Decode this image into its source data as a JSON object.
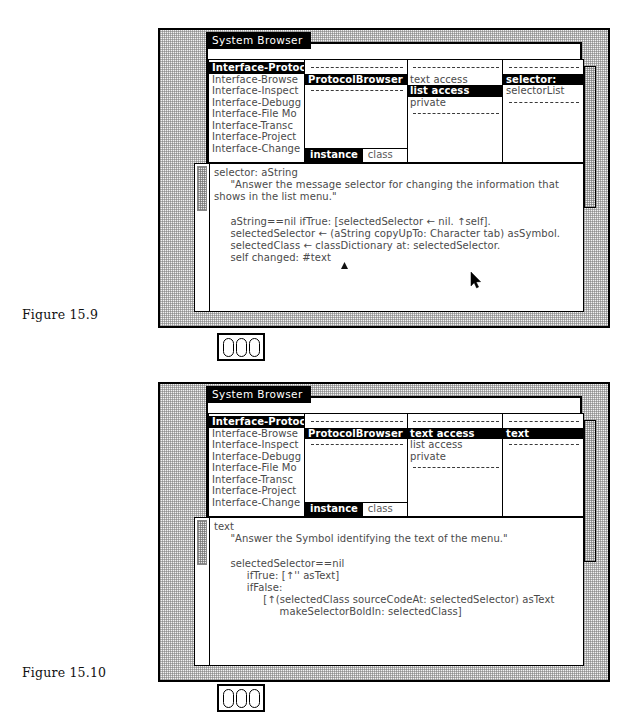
{
  "figures": [
    {
      "caption": "Figure 15.9",
      "window": {
        "title": "System Browser",
        "categories": {
          "items": [
            "Interface-Protoc",
            "Interface-Browse",
            "Interface-Inspect",
            "Interface-Debugg",
            "Interface-File Mo",
            "Interface-Transc",
            "Interface-Project",
            "Interface-Change"
          ],
          "selected_index": 0
        },
        "classes": {
          "items": [
            "ProtocolBrowser"
          ],
          "selected_index": 0,
          "tabs": [
            "instance",
            "class"
          ],
          "selected_tab": 0
        },
        "protocols": {
          "items": [
            "text access",
            "list access",
            "private"
          ],
          "selected_index": 1
        },
        "selectors": {
          "items": [
            "selector:",
            "selectorList"
          ],
          "selected_index": 0
        },
        "code": [
          "selector: aString",
          "     \"Answer the message selector for changing the information that",
          "shows in the list menu.\"",
          "",
          "     aString==nil ifTrue: [selectedSelector ← nil. ↑self].",
          "     selectedSelector ← (aString copyUpTo: Character tab) asSymbol.",
          "     selectedClass ← classDictionary at: selectedSelector.",
          "     self changed: #text"
        ]
      }
    },
    {
      "caption": "Figure 15.10",
      "window": {
        "title": "System Browser",
        "categories": {
          "items": [
            "Interface-Protoc",
            "Interface-Browse",
            "Interface-Inspect",
            "Interface-Debugg",
            "Interface-File Mo",
            "Interface-Transc",
            "Interface-Project",
            "Interface-Change"
          ],
          "selected_index": 0
        },
        "classes": {
          "items": [
            "ProtocolBrowser"
          ],
          "selected_index": 0,
          "tabs": [
            "instance",
            "class"
          ],
          "selected_tab": 0
        },
        "protocols": {
          "items": [
            "text access",
            "list access",
            "private"
          ],
          "selected_index": 0
        },
        "selectors": {
          "items": [
            "text"
          ],
          "selected_index": 0
        },
        "code": [
          "text",
          "     \"Answer the Symbol identifying the text of the menu.\"",
          "",
          "     selectedSelector==nil",
          "          ifTrue: [↑'' asText]",
          "          ifFalse:",
          "               [↑(selectedClass sourceCodeAt: selectedSelector) asText",
          "                    makeSelectorBoldIn: selectedClass]"
        ]
      }
    }
  ],
  "icons": {
    "badge": "three-bars-icon",
    "cursor": "mouse-pointer-icon",
    "caret": "text-caret-icon"
  },
  "colors": {
    "highlight_bg": "#000000",
    "highlight_fg": "#ffffff",
    "window_bg": "#ffffff",
    "desktop_pattern": "#f2f2f2",
    "text": "#4a4a4a"
  }
}
